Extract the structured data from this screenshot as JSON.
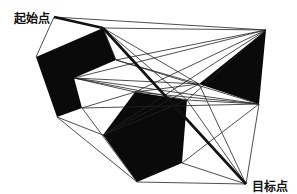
{
  "labels": {
    "start": "起始点",
    "goal": "目标点"
  },
  "colors": {
    "obstacle": "#0a0a0a",
    "edge": "#222222",
    "path": "#111111",
    "background": "#ffffff"
  },
  "graph": {
    "nodes": {
      "S": [
        54,
        17
      ],
      "G": [
        246,
        184
      ],
      "A1": [
        36,
        57
      ],
      "A2": [
        103,
        28
      ],
      "A3": [
        116,
        60
      ],
      "A4": [
        74,
        78
      ],
      "A5": [
        82,
        108
      ],
      "A6": [
        57,
        117
      ],
      "B1": [
        135,
        92
      ],
      "B2": [
        187,
        100
      ],
      "B3": [
        182,
        163
      ],
      "B4": [
        137,
        182
      ],
      "B5": [
        103,
        135
      ],
      "C1": [
        266,
        30
      ],
      "C2": [
        199,
        84
      ],
      "C3": [
        259,
        104
      ]
    },
    "obstacles": [
      [
        "A1",
        "A2",
        "A3",
        "A4",
        "A5",
        "A6"
      ],
      [
        "B1",
        "B2",
        "B3",
        "B4",
        "B5"
      ],
      [
        "C1",
        "C2",
        "C3"
      ]
    ],
    "edges": [
      [
        "S",
        "A1"
      ],
      [
        "S",
        "A2"
      ],
      [
        "S",
        "C1"
      ],
      [
        "A2",
        "C1"
      ],
      [
        "A2",
        "C2"
      ],
      [
        "A2",
        "B2"
      ],
      [
        "A2",
        "A3"
      ],
      [
        "A3",
        "C1"
      ],
      [
        "A3",
        "C2"
      ],
      [
        "A3",
        "C3"
      ],
      [
        "A4",
        "C1"
      ],
      [
        "A4",
        "C2"
      ],
      [
        "A4",
        "C3"
      ],
      [
        "A4",
        "B1"
      ],
      [
        "A4",
        "B2"
      ],
      [
        "A5",
        "C3"
      ],
      [
        "A5",
        "B1"
      ],
      [
        "A5",
        "B4"
      ],
      [
        "A6",
        "B4"
      ],
      [
        "A6",
        "B5"
      ],
      [
        "B1",
        "C1"
      ],
      [
        "B1",
        "C2"
      ],
      [
        "B1",
        "C3"
      ],
      [
        "B2",
        "C1"
      ],
      [
        "B2",
        "C3"
      ],
      [
        "B2",
        "G"
      ],
      [
        "B3",
        "C3"
      ],
      [
        "B3",
        "G"
      ],
      [
        "B4",
        "G"
      ],
      [
        "B5",
        "C2"
      ],
      [
        "B5",
        "B2"
      ],
      [
        "C2",
        "G"
      ],
      [
        "C3",
        "G"
      ],
      [
        "C1",
        "B5"
      ]
    ],
    "shortest_path": [
      "S",
      "A2",
      "G"
    ]
  }
}
